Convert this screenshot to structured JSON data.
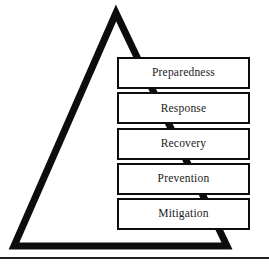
{
  "figure": {
    "name": "disaster-management-cycle-triangle",
    "title": "",
    "shape": {
      "type": "triangle-outline",
      "apex": [
        116,
        13
      ],
      "bottom_left": [
        14,
        246
      ],
      "bottom_right": [
        227,
        246
      ],
      "stroke_color": "#0d0d0d",
      "stroke_width": 7,
      "fill": "none"
    },
    "baseline_rule": {
      "color": "#222222",
      "y": 257,
      "thickness": 1.6
    },
    "background_color": "#ffffff"
  },
  "stack": {
    "name": "phase-stack",
    "x": 117,
    "y": 57,
    "width": 133,
    "box_height": 32,
    "box_border_color": "#0d0d0d",
    "box_fill": "#ffffff",
    "text_color": "#1a1a1a",
    "boxes": [
      {
        "label": "Preparedness"
      },
      {
        "label": "Response"
      },
      {
        "label": "Recovery"
      },
      {
        "label": "Prevention"
      },
      {
        "label": "Mitigation"
      }
    ]
  }
}
